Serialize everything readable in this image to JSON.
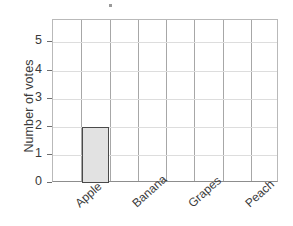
{
  "chart_data": {
    "type": "bar",
    "title": "",
    "xlabel": "",
    "ylabel": "Number of votes",
    "categories": [
      "Apple",
      "Banana",
      "Grapes",
      "Peach"
    ],
    "values": [
      2,
      0,
      0,
      0
    ],
    "ylim": [
      0,
      5.8
    ],
    "yticks": [
      0,
      1,
      2,
      3,
      4,
      5
    ],
    "ytick_labels": [
      "0",
      "1",
      "2",
      "3",
      "4",
      "5"
    ],
    "grid": true,
    "legend": false,
    "bar_fill_color": "#e2e2e2",
    "bar_edge_color": "#4a4a4a",
    "grid_color": "#dddddd",
    "frame_color": "#b9b9b9",
    "text_color": "#3a3a3a"
  },
  "artifact": {
    "mark": ""
  }
}
